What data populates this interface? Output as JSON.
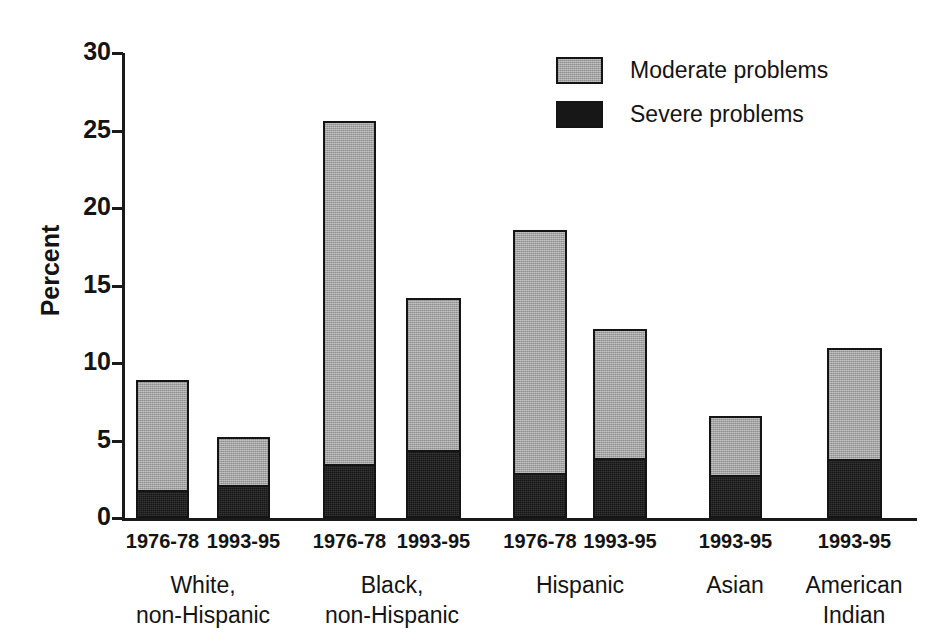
{
  "chart_data": {
    "type": "bar",
    "subtype": "stacked-bar",
    "title": "",
    "xlabel": "",
    "ylabel": "Percent",
    "ylim": [
      0,
      30
    ],
    "yticks": [
      0,
      5,
      10,
      15,
      20,
      25,
      30
    ],
    "grid": false,
    "legend_position": "top-right",
    "categories": [
      "White, non-Hispanic 1976-78",
      "White, non-Hispanic 1993-95",
      "Black, non-Hispanic 1976-78",
      "Black, non-Hispanic 1993-95",
      "Hispanic 1976-78",
      "Hispanic 1993-95",
      "Asian 1993-95",
      "American Indian 1993-95"
    ],
    "series": [
      {
        "name": "Severe problems",
        "color": "#171717",
        "values": [
          1.8,
          2.1,
          3.5,
          4.4,
          2.9,
          3.9,
          2.8,
          3.8
        ]
      },
      {
        "name": "Moderate problems",
        "color": "#a3a3a3",
        "values": [
          7.1,
          3.1,
          22.1,
          9.8,
          15.7,
          8.3,
          3.8,
          7.2
        ]
      }
    ],
    "totals": [
      8.9,
      5.2,
      25.6,
      14.2,
      18.6,
      12.2,
      6.6,
      11.0
    ]
  },
  "axis": {
    "ylabel": "Percent",
    "ytick_labels": [
      "30",
      "25",
      "20",
      "15",
      "10",
      "5",
      "0"
    ]
  },
  "legend": {
    "items": [
      {
        "label": "Moderate problems",
        "swatch": "moderate"
      },
      {
        "label": "Severe problems",
        "swatch": "severe"
      }
    ]
  },
  "groups": [
    {
      "name": "White, non-Hispanic",
      "line1": "White,",
      "line2": "non-Hispanic",
      "periods": [
        "1976-78",
        "1993-95"
      ]
    },
    {
      "name": "Black, non-Hispanic",
      "line1": "Black,",
      "line2": "non-Hispanic",
      "periods": [
        "1976-78",
        "1993-95"
      ]
    },
    {
      "name": "Hispanic",
      "line1": "Hispanic",
      "line2": "",
      "periods": [
        "1976-78",
        "1993-95"
      ]
    },
    {
      "name": "Asian",
      "line1": "Asian",
      "line2": "",
      "periods": [
        "1993-95"
      ]
    },
    {
      "name": "American Indian",
      "line1": "American",
      "line2": "Indian",
      "periods": [
        "1993-95"
      ]
    }
  ],
  "bars": [
    {
      "x": 136,
      "w": 53,
      "severe": 1.8,
      "total": 8.9,
      "period": "1976-78"
    },
    {
      "x": 217,
      "w": 53,
      "severe": 2.1,
      "total": 5.2,
      "period": "1993-95"
    },
    {
      "x": 323,
      "w": 53,
      "severe": 3.5,
      "total": 25.6,
      "period": "1976-78"
    },
    {
      "x": 406,
      "w": 55,
      "severe": 4.4,
      "total": 14.2,
      "period": "1993-95"
    },
    {
      "x": 513,
      "w": 54,
      "severe": 2.9,
      "total": 18.6,
      "period": "1976-78"
    },
    {
      "x": 593,
      "w": 54,
      "severe": 3.9,
      "total": 12.2,
      "period": "1993-95"
    },
    {
      "x": 709,
      "w": 53,
      "severe": 2.8,
      "total": 6.6,
      "period": "1993-95"
    },
    {
      "x": 827,
      "w": 55,
      "severe": 3.8,
      "total": 11.0,
      "period": "1993-95"
    }
  ],
  "group_label_positions": [
    {
      "cx": 203,
      "line1": "White,",
      "line2": "non-Hispanic"
    },
    {
      "cx": 392,
      "line1": "Black,",
      "line2": "non-Hispanic"
    },
    {
      "cx": 580,
      "line1": "Hispanic",
      "line2": ""
    },
    {
      "cx": 735,
      "line1": "Asian",
      "line2": ""
    },
    {
      "cx": 854,
      "line1": "American",
      "line2": "Indian"
    }
  ]
}
